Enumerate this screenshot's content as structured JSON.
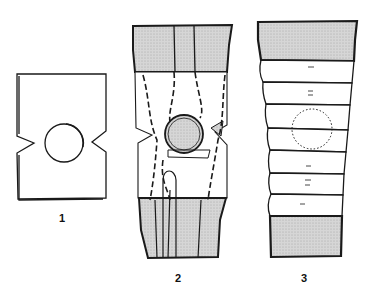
{
  "figures": [
    {
      "id": 1,
      "label": "1",
      "description": "Flat dressing pad with circular patella cut-out and side notches"
    },
    {
      "id": 2,
      "label": "2",
      "description": "Pad applied over knee with shaded bandage bands above and below, dashed tissue outlines"
    },
    {
      "id": 3,
      "label": "3",
      "description": "Knee wrapped in overlapping bandage turns, shaded end bands, dotted patella outline"
    }
  ],
  "colors": {
    "ink": "#1a1a1a",
    "shade": "#cfcfcf",
    "background": "#ffffff"
  }
}
